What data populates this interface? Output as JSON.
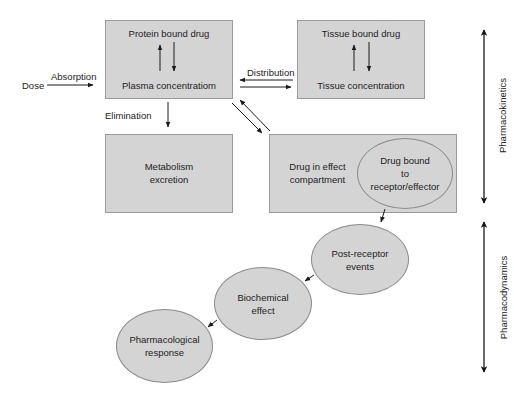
{
  "diagram": {
    "nodes": {
      "plasma_box": {
        "top_label": "Protein bound drug",
        "bottom_label": "Plasma concentratiom"
      },
      "tissue_box": {
        "top_label": "Tissue bound drug",
        "bottom_label": "Tissue concentration"
      },
      "metabolism_box": {
        "line1": "Metabolism",
        "line2": "excretion"
      },
      "effect_box": {
        "line1": "Drug in effect",
        "line2": "compartment"
      },
      "receptor_ellipse": {
        "line1": "Drug bound",
        "line2": "to",
        "line3": "receptor/effector"
      },
      "post_receptor_ellipse": {
        "line1": "Post-receptor",
        "line2": "events"
      },
      "biochemical_ellipse": {
        "line1": "Biochemical",
        "line2": "effect"
      },
      "pharmacological_ellipse": {
        "line1": "Pharmacological",
        "line2": "response"
      }
    },
    "labels": {
      "dose": "Dose",
      "absorption": "Absorption",
      "distribution": "Distribution",
      "elimination": "Elimination"
    },
    "side_axes": {
      "pharmacokinetics": "Pharmacokinetics",
      "pharmacodynamics": "Pharmacodynamics"
    },
    "edges": [
      {
        "from": "Dose",
        "to": "Plasma concentratiom",
        "label": "Absorption"
      },
      {
        "from": "Plasma concentratiom",
        "to": "Protein bound drug",
        "bidirectional": true
      },
      {
        "from": "Tissue concentration",
        "to": "Tissue bound drug",
        "bidirectional": true
      },
      {
        "from": "Plasma concentratiom",
        "to": "Tissue concentration",
        "label": "Distribution",
        "bidirectional": true
      },
      {
        "from": "Plasma concentratiom",
        "to": "Metabolism excretion",
        "label": "Elimination"
      },
      {
        "from": "Plasma concentratiom",
        "to": "Drug in effect compartment",
        "bidirectional": true
      },
      {
        "from": "Drug bound to receptor/effector",
        "to": "Post-receptor events"
      },
      {
        "from": "Post-receptor events",
        "to": "Biochemical effect"
      },
      {
        "from": "Biochemical effect",
        "to": "Pharmacological response"
      }
    ],
    "colors": {
      "node_fill": "#d4d4d4",
      "node_border": "#9a9a9a",
      "arrow": "#1a1a1a",
      "text": "#222222"
    }
  }
}
